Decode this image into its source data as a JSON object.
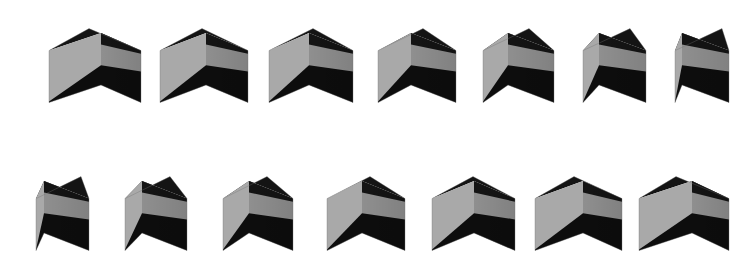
{
  "canvas": {
    "width": 750,
    "height": 266,
    "background": "#ffffff",
    "title": "Rotating banded cubes sequence"
  },
  "palette": {
    "background": "#ffffff",
    "face_left_light": "#a9a9a9",
    "face_left_mid": "#9b9b9b",
    "face_right_mid": "#8f8f8f",
    "face_right_dark": "#848484",
    "band_black": "#0d0d0d",
    "top_black": "#141414",
    "edge_shadow": "#6f6f6f"
  },
  "layout": {
    "rows": 2,
    "columns": 7,
    "total_cubes": 14,
    "row1_center_y": 60,
    "row2_center_y": 208,
    "column_centers_row1": [
      95,
      204,
      311,
      417,
      518,
      614,
      702
    ],
    "column_centers_row2": [
      62,
      156,
      258,
      366,
      473,
      578,
      684
    ],
    "cube_height": 96
  },
  "description": {
    "subject": "cube",
    "count_label": "14",
    "motion": "rotation",
    "rows_label": "2 rows of 7",
    "note": "Each cube shows a black top face, a light grey horizontal band across the front, and black wedges at the lower front; the viewing azimuth advances step by step across the sequence."
  },
  "cubes": [
    {
      "index": 1,
      "row": 1,
      "col": 1,
      "cx": 95,
      "cy": 60,
      "azimuth_deg": 0,
      "half_left": 52,
      "half_right": 40,
      "top_rise": 22,
      "scale": 1.0,
      "name": "cube-1"
    },
    {
      "index": 2,
      "row": 1,
      "col": 2,
      "cx": 204,
      "cy": 60,
      "azimuth_deg": 7,
      "half_left": 46,
      "half_right": 42,
      "top_rise": 22,
      "scale": 1.0,
      "name": "cube-2"
    },
    {
      "index": 3,
      "row": 1,
      "col": 3,
      "cx": 311,
      "cy": 60,
      "azimuth_deg": 14,
      "half_left": 40,
      "half_right": 44,
      "top_rise": 22,
      "scale": 1.0,
      "name": "cube-3"
    },
    {
      "index": 4,
      "row": 1,
      "col": 4,
      "cx": 417,
      "cy": 60,
      "azimuth_deg": 21,
      "half_left": 33,
      "half_right": 45,
      "top_rise": 22,
      "scale": 1.0,
      "name": "cube-4"
    },
    {
      "index": 5,
      "row": 1,
      "col": 5,
      "cx": 518,
      "cy": 60,
      "azimuth_deg": 28,
      "half_left": 25,
      "half_right": 46,
      "top_rise": 22,
      "scale": 1.0,
      "name": "cube-5"
    },
    {
      "index": 6,
      "row": 1,
      "col": 6,
      "cx": 614,
      "cy": 60,
      "azimuth_deg": 35,
      "half_left": 16,
      "half_right": 47,
      "top_rise": 22,
      "scale": 1.0,
      "name": "cube-6"
    },
    {
      "index": 7,
      "row": 1,
      "col": 7,
      "cx": 702,
      "cy": 60,
      "azimuth_deg": 42,
      "half_left": 7,
      "half_right": 47,
      "top_rise": 22,
      "scale": 1.0,
      "name": "cube-7"
    },
    {
      "index": 8,
      "row": 2,
      "col": 1,
      "cx": 62,
      "cy": 208,
      "azimuth_deg": 49,
      "half_left": 8,
      "half_right": 45,
      "top_rise": 22,
      "scale": 1.0,
      "name": "cube-8"
    },
    {
      "index": 9,
      "row": 2,
      "col": 2,
      "cx": 156,
      "cy": 208,
      "azimuth_deg": 56,
      "half_left": 17,
      "half_right": 45,
      "top_rise": 22,
      "scale": 1.0,
      "name": "cube-9"
    },
    {
      "index": 10,
      "row": 2,
      "col": 3,
      "cx": 258,
      "cy": 208,
      "azimuth_deg": 63,
      "half_left": 26,
      "half_right": 44,
      "top_rise": 22,
      "scale": 1.0,
      "name": "cube-10"
    },
    {
      "index": 11,
      "row": 2,
      "col": 4,
      "cx": 366,
      "cy": 208,
      "azimuth_deg": 70,
      "half_left": 35,
      "half_right": 43,
      "top_rise": 22,
      "scale": 1.0,
      "name": "cube-11"
    },
    {
      "index": 12,
      "row": 2,
      "col": 5,
      "cx": 473,
      "cy": 208,
      "azimuth_deg": 77,
      "half_left": 42,
      "half_right": 41,
      "top_rise": 22,
      "scale": 1.0,
      "name": "cube-12"
    },
    {
      "index": 13,
      "row": 2,
      "col": 6,
      "cx": 578,
      "cy": 208,
      "azimuth_deg": 84,
      "half_left": 48,
      "half_right": 39,
      "top_rise": 22,
      "scale": 1.0,
      "name": "cube-13"
    },
    {
      "index": 14,
      "row": 2,
      "col": 7,
      "cx": 684,
      "cy": 208,
      "azimuth_deg": 90,
      "half_left": 53,
      "half_right": 37,
      "top_rise": 22,
      "scale": 1.0,
      "name": "cube-14"
    }
  ]
}
